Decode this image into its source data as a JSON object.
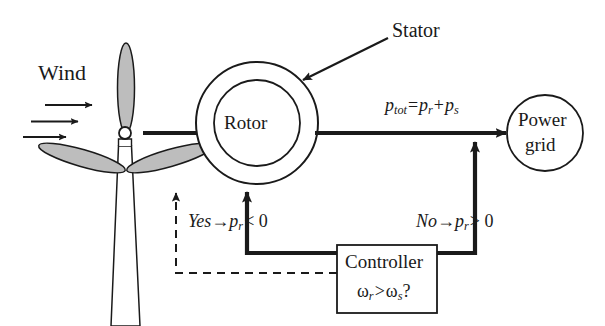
{
  "diagram": {
    "colors": {
      "line": "#1a1a1a",
      "blade_fill": "#bdbdbd",
      "background": "#ffffff"
    },
    "labels": {
      "wind": "Wind",
      "stator": "Stator",
      "rotor": "Rotor",
      "power_flow_equation": "ptot = pr + ps",
      "power_flow_parts": {
        "p": "p",
        "tot": "tot",
        "equals": "=",
        "pr": "p",
        "r": "r",
        "plus": "+",
        "ps": "p",
        "s": "s"
      },
      "yes_branch": "Yes →pr< 0",
      "yes_branch_parts": {
        "yes": "Yes",
        "arrow": "→",
        "p": "p",
        "sub": "r",
        "op": "< 0"
      },
      "no_branch": "No →pr> 0",
      "no_branch_parts": {
        "no": "No",
        "arrow": "→",
        "p": "p",
        "sub": "r",
        "op": "> 0"
      },
      "controller": "Controller",
      "controller_condition": "ωr > ωs?",
      "controller_condition_parts": {
        "omega_r": "ω",
        "sub_r": "r",
        "gt": ">",
        "omega_s": "ω",
        "sub_s": "s",
        "q": "?"
      },
      "power_grid_line1": "Power",
      "power_grid_line2": "grid"
    },
    "nodes": {
      "stator_circle": {
        "cx": 257,
        "cy": 123,
        "r": 61
      },
      "rotor_circle": {
        "cx": 257,
        "cy": 123,
        "r": 43
      },
      "power_grid_circle": {
        "cx": 545,
        "cy": 133,
        "r": 38
      },
      "controller_box": {
        "x": 337,
        "y": 245,
        "w": 100,
        "h": 68
      },
      "turbine_hub": {
        "cx": 125,
        "cy": 133,
        "r": 6
      }
    },
    "icons": {
      "wind_arrows": "wind-arrow-icon",
      "turbine": "wind-turbine-icon",
      "stator_pointer": "stator-callout-arrow-icon",
      "feedback": "dashed-feedback-arrow-icon"
    }
  }
}
